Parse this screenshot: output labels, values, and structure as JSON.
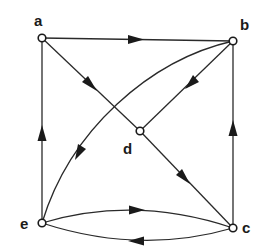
{
  "diagram": {
    "type": "directed-graph",
    "colors": {
      "stroke": "#2a2a2a",
      "node_fill": "#ffffff",
      "background": "#ffffff"
    },
    "nodes": [
      {
        "id": "a",
        "label": "a",
        "x": 42,
        "y": 38,
        "lx": 34,
        "ly": 26
      },
      {
        "id": "b",
        "label": "b",
        "x": 233,
        "y": 41,
        "lx": 240,
        "ly": 30
      },
      {
        "id": "d",
        "label": "d",
        "x": 140,
        "y": 131,
        "lx": 123,
        "ly": 154
      },
      {
        "id": "e",
        "label": "e",
        "x": 42,
        "y": 223,
        "lx": 21,
        "ly": 229
      },
      {
        "id": "c",
        "label": "c",
        "x": 233,
        "y": 228,
        "lx": 242,
        "ly": 233
      }
    ],
    "edges": [
      {
        "from": "a",
        "to": "b",
        "label": "a-to-b"
      },
      {
        "from": "a",
        "to": "d",
        "label": "a-to-d"
      },
      {
        "from": "d",
        "to": "c",
        "label": "d-to-c"
      },
      {
        "from": "b",
        "to": "d",
        "label": "b-to-d"
      },
      {
        "from": "b",
        "to": "e",
        "label": "b-to-e",
        "curved": true
      },
      {
        "from": "e",
        "to": "a",
        "label": "e-to-a"
      },
      {
        "from": "c",
        "to": "b",
        "label": "c-to-b"
      },
      {
        "from": "e",
        "to": "c",
        "label": "e-to-c",
        "curved": true
      },
      {
        "from": "c",
        "to": "e",
        "label": "c-to-e",
        "curved": true
      }
    ]
  }
}
